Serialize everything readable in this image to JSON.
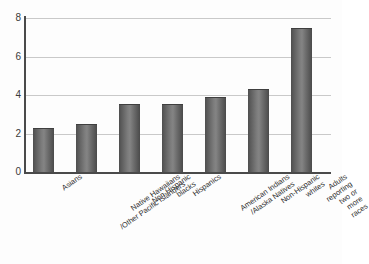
{
  "chart_data": {
    "type": "bar",
    "title": "",
    "subtitle": "",
    "xlabel": "",
    "ylabel": "",
    "ylim": [
      0,
      8
    ],
    "yticks": [
      0,
      2,
      4,
      6,
      8
    ],
    "grid": true,
    "legend": null,
    "orientation": "vertical",
    "categories": [
      "Asians",
      "Native Hawaiians\n/Other Pacific Islanders",
      "Non-Hispanic\nblacks",
      "Hispanics",
      "American Indians\n/Alaska Natives",
      "Non-Hispanic\nwhites",
      "Adults reporting\ntwo or more races"
    ],
    "values": [
      2.25,
      2.45,
      3.5,
      3.5,
      3.85,
      4.25,
      7.45
    ],
    "series": [
      {
        "name": "",
        "values": [
          2.25,
          2.45,
          3.5,
          3.5,
          3.85,
          4.25,
          7.45
        ]
      }
    ],
    "bar_color": "#6b6b6b",
    "grid_color": "#c9c9c9",
    "axis_color": "#4a4a4a",
    "background": "#fdfdfd"
  }
}
